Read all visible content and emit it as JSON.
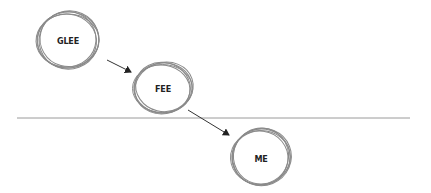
{
  "diagram": {
    "type": "sketched-node-chain",
    "colors": {
      "circle_stroke": "#8a8a8a",
      "arrow": "#333333",
      "divider": "#999999",
      "text": "#222222",
      "background": "#ffffff"
    },
    "nodes": [
      {
        "id": "glee",
        "label": "GLEE",
        "cx": 68,
        "cy": 40,
        "rx": 31,
        "ry": 29
      },
      {
        "id": "fee",
        "label": "FEE",
        "cx": 163,
        "cy": 88,
        "rx": 29,
        "ry": 25
      },
      {
        "id": "me",
        "label": "ME",
        "cx": 261,
        "cy": 157,
        "rx": 29,
        "ry": 29
      }
    ],
    "edges": [
      {
        "from": "GLEE",
        "to": "FEE"
      },
      {
        "from": "FEE",
        "to": "ME"
      }
    ],
    "divider": {
      "y": 118,
      "x1": 17,
      "x2": 410
    }
  }
}
